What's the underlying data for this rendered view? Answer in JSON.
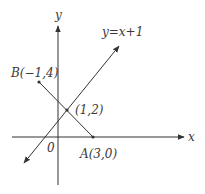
{
  "diagram": {
    "axes": {
      "x_label": "x",
      "y_label": "y",
      "origin_label": "0"
    },
    "line": {
      "equation_label": "y=x+1"
    },
    "points": {
      "A": {
        "label": "A(3,0)",
        "x": 3,
        "y": 0
      },
      "B": {
        "label": "B(−1,4)",
        "x": -1,
        "y": 4
      },
      "intersection": {
        "label": "(1,2)",
        "x": 1,
        "y": 2
      }
    },
    "colors": {
      "stroke": "#333333",
      "text": "#3a3a3a",
      "background": "#ffffff"
    }
  }
}
